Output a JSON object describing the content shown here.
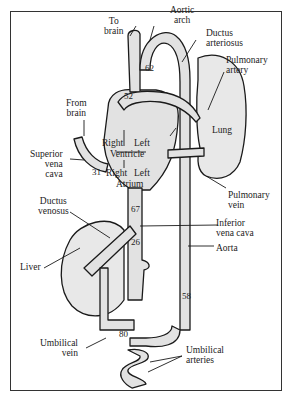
{
  "figure": {
    "labels": {
      "to_brain": [
        "To",
        "brain"
      ],
      "aortic_arch": [
        "Aortic",
        "arch"
      ],
      "ductus_arteriosus": [
        "Ductus",
        "arteriosus"
      ],
      "pulmonary_artery": [
        "Pulmonary",
        "artery"
      ],
      "from_brain": [
        "From",
        "brain"
      ],
      "lung": "Lung",
      "superior_vena_cava": [
        "Superior",
        "vena",
        "cava"
      ],
      "right_ventricle": "Right",
      "left_ventricle": "Left",
      "ventricle": "Ventricle",
      "right_atrium": "Right",
      "left_atrium": "Left",
      "atrium": "Atrium",
      "pulmonary_vein": [
        "Pulmonary",
        "vein"
      ],
      "ductus_venosus": [
        "Ductus",
        "venosus"
      ],
      "inferior_vena_cava": [
        "Inferior",
        "vena cava"
      ],
      "liver": "Liver",
      "aorta": "Aorta",
      "umbilical_vein": [
        "Umbilical",
        "vein"
      ],
      "umbilical_arteries": [
        "Umbilical",
        "arteries"
      ]
    },
    "oxygen_saturation_values": {
      "aortic_arch_to_brain": "62",
      "pulmonary_trunk": "52",
      "superior_vena_cava": "31",
      "inferior_vena_cava_upper": "67",
      "inferior_vena_cava_lower": "26",
      "descending_aorta": "58",
      "umbilical_vein": "80"
    },
    "colors": {
      "vessel_fill": "#e4e4e4",
      "organ_fill": "#e9e9e9",
      "stroke": "#1a1a1a",
      "border": "#333333"
    }
  }
}
